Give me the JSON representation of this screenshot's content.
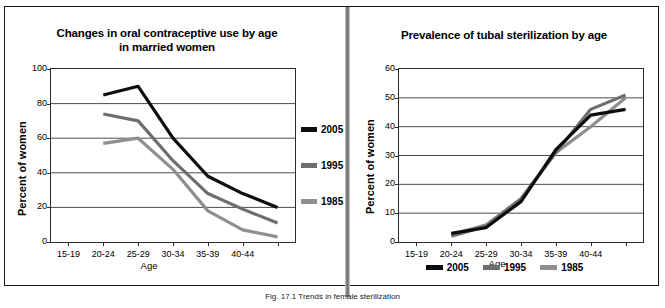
{
  "figure": {
    "caption": "Fig. 17.1 Trends in female sterilization"
  },
  "colors": {
    "series_2005": "#0d0d0d",
    "series_1995": "#6e6e6e",
    "series_1985": "#8f8f8f",
    "axis": "#2a2a2a",
    "grid": "#4d4d4d",
    "frame": "#1b1b1b",
    "divider": "#6f6f6f",
    "background": "#ffffff"
  },
  "left_panel": {
    "ylabel": "Percent of women",
    "xlabel": "Age",
    "legend": [
      {
        "label": "2005",
        "color": "#0d0d0d"
      },
      {
        "label": "1995",
        "color": "#6e6e6e"
      },
      {
        "label": "1985",
        "color": "#8f8f8f"
      }
    ]
  },
  "right_panel": {
    "ylabel": "Percent of women",
    "xlabel": "Age",
    "legend": [
      {
        "label": "2005",
        "color": "#0d0d0d"
      },
      {
        "label": "1995",
        "color": "#6e6e6e"
      },
      {
        "label": "1985",
        "color": "#8f8f8f"
      }
    ]
  },
  "chart_data": [
    {
      "id": "oral-contraceptive-use",
      "type": "line",
      "title": "Changes in oral contraceptive use by age in married women",
      "title_lines": [
        "Changes in oral contraceptive use by age",
        "in married women"
      ],
      "xlabel": "Age",
      "ylabel": "Percent of women",
      "categories": [
        "15-19",
        "20-24",
        "25-29",
        "30-34",
        "35-39",
        "40-44",
        ""
      ],
      "xtick_labels": [
        "15-19",
        "20-24",
        "25-29",
        "30-34",
        "35-39",
        "40-44"
      ],
      "ylim": [
        0,
        100
      ],
      "yticks": [
        0,
        20,
        40,
        60,
        80,
        100
      ],
      "grid": true,
      "legend_position": "right",
      "series": [
        {
          "name": "2005",
          "color": "#0d0d0d",
          "values": [
            null,
            85,
            90,
            60,
            38,
            28,
            20
          ]
        },
        {
          "name": "1995",
          "color": "#6e6e6e",
          "values": [
            null,
            74,
            70,
            47,
            28,
            19,
            11
          ]
        },
        {
          "name": "1985",
          "color": "#8f8f8f",
          "values": [
            null,
            57,
            60,
            42,
            18,
            7,
            3
          ]
        }
      ]
    },
    {
      "id": "tubal-sterilization-prevalence",
      "type": "line",
      "title": "Prevalence of tubal sterilization by age",
      "title_lines": [
        "Prevalence of tubal sterilization by age"
      ],
      "xlabel": "Age",
      "ylabel": "Percent of women",
      "categories": [
        "15-19",
        "20-24",
        "25-29",
        "30-34",
        "35-39",
        "40-44",
        ""
      ],
      "xtick_labels": [
        "15-19",
        "20-24",
        "25-29",
        "30-34",
        "35-39",
        "40-44"
      ],
      "ylim": [
        0,
        60
      ],
      "yticks": [
        0,
        10,
        20,
        30,
        40,
        50,
        60
      ],
      "grid": true,
      "legend_position": "bottom",
      "series": [
        {
          "name": "2005",
          "color": "#0d0d0d",
          "values": [
            null,
            3,
            5,
            14,
            32,
            44,
            46
          ]
        },
        {
          "name": "1995",
          "color": "#6e6e6e",
          "values": [
            null,
            2,
            5.5,
            15,
            31,
            46,
            51
          ]
        },
        {
          "name": "1985",
          "color": "#8f8f8f",
          "values": [
            null,
            2.5,
            6,
            15,
            31,
            40,
            50
          ]
        }
      ]
    }
  ]
}
